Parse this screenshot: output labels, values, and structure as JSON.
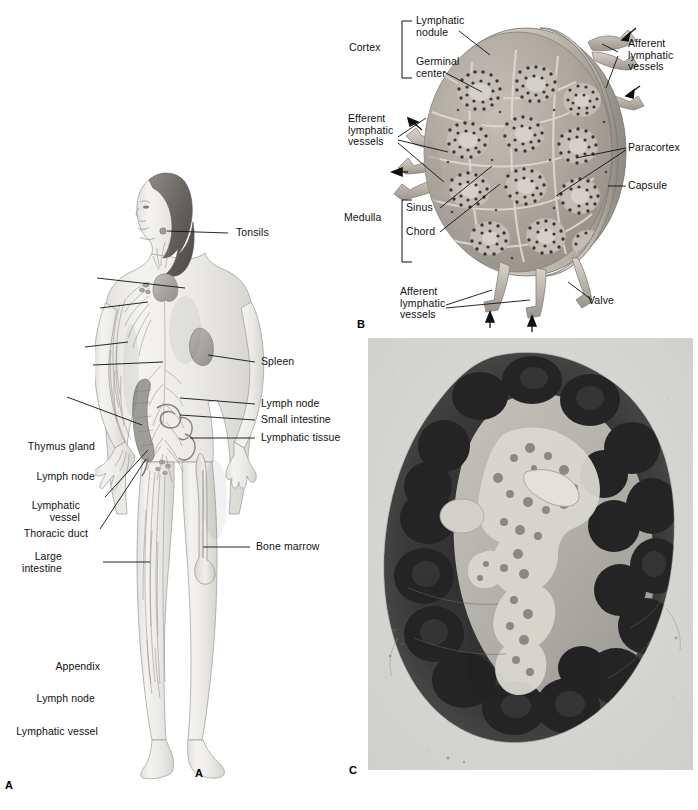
{
  "figure": {
    "panels": [
      {
        "letter": "A",
        "name": "panel-a-lymphatic-system",
        "caption": "Lymphatic system of the body (anterior view)"
      },
      {
        "letter": "B",
        "name": "panel-b-lymph-node-diagram",
        "caption": "Sectioned lymph node diagram"
      },
      {
        "letter": "C",
        "name": "panel-c-lymph-node-micrograph",
        "caption": "Light micrograph of a sectioned lymph node"
      }
    ]
  },
  "panel_a": {
    "letter_bottom_left": "A",
    "letter_under_figure": "A",
    "labels_left": [
      {
        "id": "thymus-gland",
        "text": "Thymus gland"
      },
      {
        "id": "lymph-node-axilla",
        "text": "Lymph node"
      },
      {
        "id": "lymphatic-vessel-arm",
        "text": "Lymphatic\nvessel"
      },
      {
        "id": "thoracic-duct",
        "text": "Thoracic duct"
      },
      {
        "id": "large-intestine",
        "text": "Large\nintestine"
      },
      {
        "id": "appendix",
        "text": "Appendix"
      },
      {
        "id": "lymph-node-groin",
        "text": "Lymph node"
      },
      {
        "id": "lymphatic-vessel-leg",
        "text": "Lymphatic vessel"
      }
    ],
    "labels_right": [
      {
        "id": "tonsils",
        "text": "Tonsils"
      },
      {
        "id": "spleen",
        "text": "Spleen"
      },
      {
        "id": "lymph-node-abdomen",
        "text": "Lymph node"
      },
      {
        "id": "small-intestine",
        "text": "Small intestine"
      },
      {
        "id": "lymphatic-tissue",
        "text": "Lymphatic tissue"
      },
      {
        "id": "bone-marrow",
        "text": "Bone marrow"
      }
    ]
  },
  "panel_b": {
    "letter": "B",
    "brackets": [
      {
        "id": "cortex",
        "text": "Cortex"
      },
      {
        "id": "medulla",
        "text": "Medulla"
      }
    ],
    "labels": [
      {
        "id": "lymphatic-nodule",
        "text": "Lymphatic\nnodule"
      },
      {
        "id": "germinal-center",
        "text": "Germinal\ncenter"
      },
      {
        "id": "efferent-lymphatic-vessels",
        "text": "Efferent\nlymphatic\nvessels"
      },
      {
        "id": "sinus",
        "text": "Sinus"
      },
      {
        "id": "chord",
        "text": "Chord"
      },
      {
        "id": "afferent-lymphatic-vessels-top",
        "text": "Afferent\nlymphatic\nvessels"
      },
      {
        "id": "paracortex",
        "text": "Paracortex"
      },
      {
        "id": "capsule",
        "text": "Capsule"
      },
      {
        "id": "valve",
        "text": "Valve"
      },
      {
        "id": "afferent-lymphatic-vessels-bottom",
        "text": "Afferent\nlymphatic\nvessels"
      }
    ]
  },
  "panel_c": {
    "letter": "C"
  },
  "colors": {
    "background": "#ffffff",
    "label_text": "#111111",
    "leader_line": "#111111",
    "node_capsule": "#b9b2a8",
    "node_cortex": "#a9a49c",
    "node_medulla": "#b6b1a8",
    "node_vessel": "#c7c0b4",
    "micrograph_bg": "#d8d8d4",
    "micrograph_dark": "#2e2e2e",
    "body_skin": "#efeeea",
    "body_outline": "#9a9a96",
    "body_hair": "#6d6b66",
    "organ_gray": "#a8a6a1"
  }
}
